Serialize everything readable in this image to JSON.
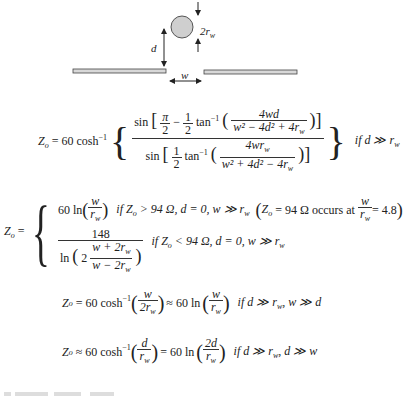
{
  "diagram": {
    "labels": {
      "diameter": "2r",
      "diameter_sub": "w",
      "height": "d",
      "gap": "w"
    },
    "colors": {
      "wire_fill": "#cfcfcf",
      "plate_fill": "#d8d8d8",
      "stroke": "#333333"
    }
  },
  "equations": {
    "eq1": {
      "lhs": "Z",
      "lhs_sub": "o",
      "prefix": "= 60 cosh",
      "prefix_sup": "−1",
      "num_func": "sin",
      "num_pi": "π",
      "num_2": "2",
      "num_minus": "−",
      "half_num": "1",
      "half_den": "2",
      "atan": "tan",
      "atan_sup": "−1",
      "num_inner_num": "4wd",
      "num_inner_den": "w² − 4d² + 4r",
      "num_inner_den_sub": "w",
      "num_inner_den_sup": "2",
      "den_func": "sin",
      "den_inner_num": "4wr",
      "den_inner_num_sub": "w",
      "den_inner_den": "w² + 4d² − 4r",
      "den_inner_den_sub": "w",
      "den_inner_den_sup": "2",
      "condition": "if d ≫ r",
      "condition_sub": "w"
    },
    "eq2": {
      "lhs": "Z",
      "lhs_sub": "o",
      "eq": "=",
      "case1_expr": "60 ln",
      "case1_num": "w",
      "case1_den": "r",
      "case1_den_sub": "w",
      "case1_cond": "if Z",
      "case1_cond_sub": "o",
      "case1_cond_rest": "> 94 Ω, d = 0, w ≫ r",
      "case1_cond_rest_sub": "w",
      "note_pre": "Z",
      "note_sub": "o",
      "note_mid": "= 94 Ω occurs at",
      "note_num": "w",
      "note_den": "r",
      "note_den_sub": "w",
      "note_val": "= 4.8",
      "case2_num": "148",
      "case2_ln": "ln",
      "case2_two": "2",
      "case2_inner_num": "w + 2r",
      "case2_inner_num_sub": "w",
      "case2_inner_den": "w − 2r",
      "case2_inner_den_sub": "w",
      "case2_cond": "if Z",
      "case2_cond_sub": "o",
      "case2_cond_rest": "< 94 Ω, d = 0, w ≫ r",
      "case2_cond_rest_sub": "w"
    },
    "eq3": {
      "lhs": "Z",
      "lhs_sub": "o",
      "prefix": "= 60 cosh",
      "prefix_sup": "−1",
      "f1_num": "w",
      "f1_den": "2r",
      "f1_den_sub": "w",
      "approx": "≈ 60 ln",
      "f2_num": "w",
      "f2_den": "r",
      "f2_den_sub": "w",
      "cond": "if d ≫ r",
      "cond_sub": "w",
      "cond_rest": ",  w ≫ d"
    },
    "eq4": {
      "lhs": "Z",
      "lhs_sub": "o",
      "prefix": "≈ 60 cosh",
      "prefix_sup": "−1",
      "f1_num": "d",
      "f1_den": "r",
      "f1_den_sub": "w",
      "approx": "= 60 ln",
      "f2_num": "2d",
      "f2_den": "r",
      "f2_den_sub": "w",
      "cond": "if d ≫ r",
      "cond_sub": "w",
      "cond_rest": ",  d ≫ w"
    }
  }
}
